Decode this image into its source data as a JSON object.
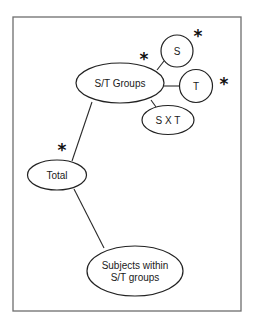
{
  "diagram": {
    "type": "tree",
    "nodes": [
      {
        "id": "st_groups",
        "label": "S/T Groups",
        "shape": "ellipse",
        "significant": true
      },
      {
        "id": "s",
        "label": "S",
        "shape": "circle",
        "significant": true
      },
      {
        "id": "t",
        "label": "T",
        "shape": "circle",
        "significant": true
      },
      {
        "id": "sxt",
        "label": "S X T",
        "shape": "ellipse",
        "significant": false
      },
      {
        "id": "total",
        "label": "Total",
        "shape": "ellipse",
        "significant": true
      },
      {
        "id": "subjects",
        "label_line1": "Subjects within",
        "label_line2": "S/T groups",
        "shape": "ellipse",
        "significant": false
      }
    ],
    "edges": [
      {
        "from": "total",
        "to": "st_groups"
      },
      {
        "from": "total",
        "to": "subjects"
      },
      {
        "from": "st_groups",
        "to": "s"
      },
      {
        "from": "st_groups",
        "to": "t"
      },
      {
        "from": "st_groups",
        "to": "sxt"
      }
    ],
    "marker": "*",
    "marker_meaning": "significant"
  }
}
